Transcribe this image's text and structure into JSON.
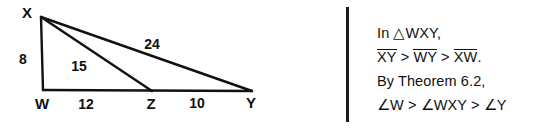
{
  "figure": {
    "type": "geometry-diagram",
    "vertices": [
      {
        "name": "X",
        "label": "X",
        "x": 41,
        "y": 17,
        "label_x": 27,
        "label_y": 14
      },
      {
        "name": "W",
        "label": "W",
        "x": 43,
        "y": 90,
        "label_x": 42,
        "label_y": 105
      },
      {
        "name": "Z",
        "label": "Z",
        "x": 152,
        "y": 91,
        "label_x": 151,
        "label_y": 105
      },
      {
        "name": "Y",
        "label": "Y",
        "x": 252,
        "y": 91,
        "label_x": 251,
        "label_y": 104
      }
    ],
    "segments": [
      {
        "name": "segment-XW",
        "from": "X",
        "to": "W"
      },
      {
        "name": "segment-XZ",
        "from": "X",
        "to": "Z"
      },
      {
        "name": "segment-XY",
        "from": "X",
        "to": "Y"
      },
      {
        "name": "segment-WY",
        "from": "W",
        "to": "Y"
      }
    ],
    "measures": [
      {
        "name": "length-XW",
        "value": "8",
        "x": 23,
        "y": 60
      },
      {
        "name": "length-XZ",
        "value": "15",
        "x": 79,
        "y": 67
      },
      {
        "name": "length-XY",
        "value": "24",
        "x": 152,
        "y": 45
      },
      {
        "name": "length-WZ",
        "value": "12",
        "x": 86,
        "y": 105
      },
      {
        "name": "length-ZY",
        "value": "10",
        "x": 197,
        "y": 104
      }
    ]
  },
  "divider": {
    "name": "vertical-rule",
    "color": "#1a1a1a"
  },
  "solution": {
    "line1": "In △WXY,",
    "line2": {
      "seg1": "XY",
      "op1": ">",
      "seg2": "WY",
      "op2": ">",
      "seg3": "XW",
      "period": "."
    },
    "line3": "By Theorem 6.2,",
    "line4": "∠W > ∠WXY > ∠Y"
  }
}
